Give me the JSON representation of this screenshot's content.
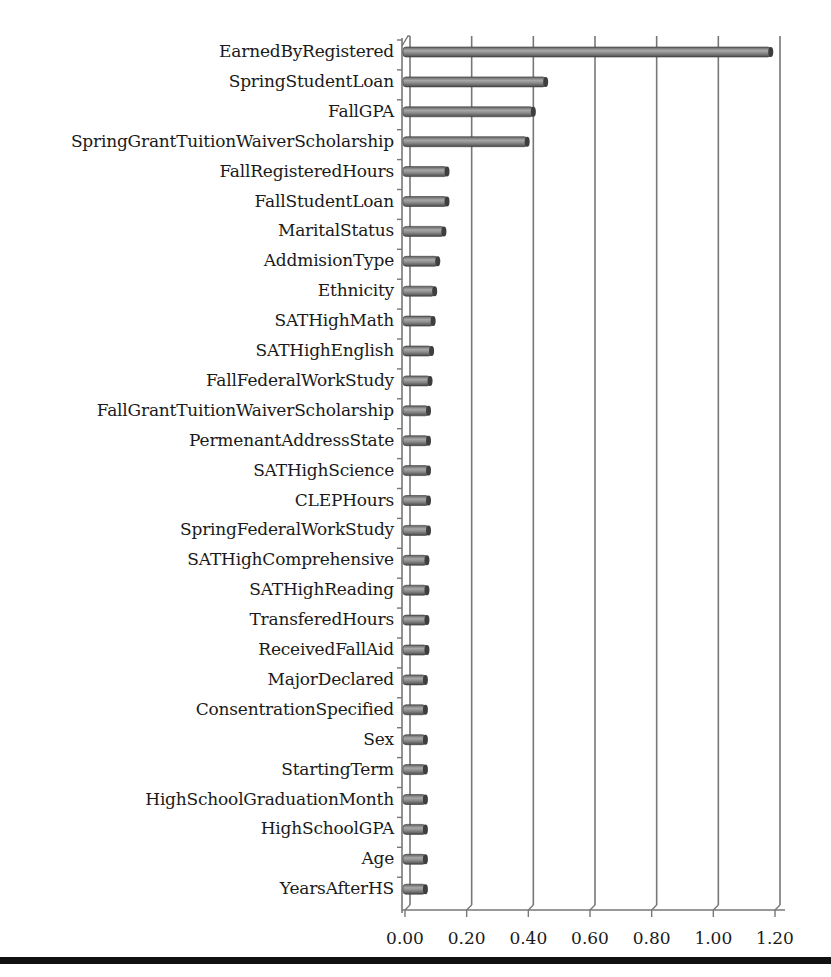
{
  "chart_data": {
    "type": "bar",
    "orientation": "horizontal",
    "title": "",
    "xlabel": "",
    "ylabel": "",
    "xlim": [
      0,
      1.2
    ],
    "x_ticks": [
      "0.00",
      "0.20",
      "0.40",
      "0.60",
      "0.80",
      "1.00",
      "1.20"
    ],
    "grid": "vertical",
    "legend": "none",
    "style": "3D cylinder bars, gray",
    "bar_color": "#8a8a8a",
    "categories": [
      "EarnedByRegistered",
      "SpringStudentLoan",
      "FallGPA",
      "SpringGrantTuitionWaiverScholarship",
      "FallRegisteredHours",
      "FallStudentLoan",
      "MaritalStatus",
      "AddmisionType",
      "Ethnicity",
      "SATHighMath",
      "SATHighEnglish",
      "FallFederalWorkStudy",
      "FallGrantTuitionWaiverScholarship",
      "PermenantAddressState",
      "SATHighScience",
      "CLEPHours",
      "SpringFederalWorkStudy",
      "SATHighComprehensive",
      "SATHighReading",
      "TransferedHours",
      "ReceivedFallAid",
      "MajorDeclared",
      "ConsentrationSpecified",
      "Sex",
      "StartingTerm",
      "HighSchoolGraduationMonth",
      "HighSchoolGPA",
      "Age",
      "YearsAfterHS"
    ],
    "values": [
      1.17,
      0.44,
      0.4,
      0.38,
      0.12,
      0.12,
      0.11,
      0.09,
      0.08,
      0.075,
      0.07,
      0.065,
      0.06,
      0.06,
      0.06,
      0.06,
      0.06,
      0.055,
      0.055,
      0.055,
      0.055,
      0.05,
      0.05,
      0.05,
      0.05,
      0.05,
      0.05,
      0.05,
      0.05
    ]
  }
}
